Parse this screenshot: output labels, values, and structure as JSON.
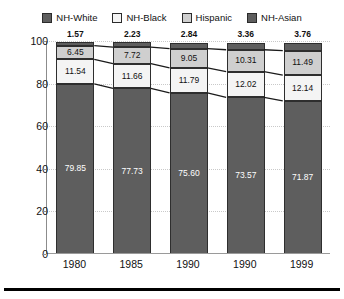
{
  "legend": {
    "items": [
      {
        "label": "NH-White",
        "color": "#5e5e5e"
      },
      {
        "label": "NH-Black",
        "color": "#f4f4f4"
      },
      {
        "label": "Hispanic",
        "color": "#cfcfcf"
      },
      {
        "label": "NH-Asian",
        "color": "#5e5e5e"
      }
    ]
  },
  "axes": {
    "y_title": "Percent",
    "y_ticks": [
      "0",
      "20",
      "40",
      "60",
      "80",
      "100"
    ],
    "x_ticks": [
      "1980",
      "1985",
      "1990",
      "1990",
      "1999"
    ]
  },
  "chart_data": {
    "type": "bar",
    "stacked": true,
    "title": "",
    "subtitle": "",
    "xlabel": "",
    "ylabel": "Percent",
    "ylim": [
      0,
      100
    ],
    "ytick_interval": 20,
    "grid": true,
    "legend_position": "top",
    "annotations": "Segment values printed inside each bar; NH-Asian values printed above each bar. Connector lines join matching segment boundaries across adjacent bars.",
    "categories": [
      "1980",
      "1985",
      "1990",
      "1990",
      "1999"
    ],
    "series": [
      {
        "name": "NH-White",
        "color": "#5e5e5e",
        "values": [
          79.85,
          77.73,
          75.6,
          73.57,
          71.87
        ]
      },
      {
        "name": "NH-Black",
        "color": "#f4f4f4",
        "values": [
          11.54,
          11.66,
          11.79,
          12.02,
          12.14
        ]
      },
      {
        "name": "Hispanic",
        "color": "#cfcfcf",
        "values": [
          6.45,
          7.72,
          9.05,
          10.31,
          11.49
        ]
      },
      {
        "name": "NH-Asian",
        "color": "#5e5e5e",
        "values": [
          1.57,
          2.23,
          2.84,
          3.36,
          3.76
        ]
      }
    ]
  }
}
